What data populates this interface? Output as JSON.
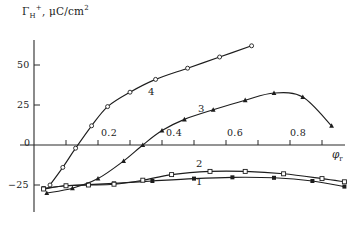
{
  "chart_data": {
    "type": "line",
    "title": "",
    "ylabel": "Γ H+, μC/cm2",
    "ylabel_main": "Γ",
    "ylabel_sub": "H",
    "ylabel_plus": "+",
    "ylabel_units": ", μC/cm",
    "ylabel_exp": "2",
    "xlabel": "φ",
    "xlabel_sub": "r",
    "xlim": [
      0.0,
      1.0
    ],
    "ylim": [
      -40,
      65
    ],
    "grid": false,
    "legend_position": "inline-curve-labels",
    "xticks": [
      0.2,
      0.4,
      0.6,
      0.8
    ],
    "xtick_labels": [
      "0.2",
      "0.4",
      "0.6",
      "0.8"
    ],
    "yticks": [
      50,
      25,
      0,
      -25
    ],
    "ytick_labels": [
      "50",
      "25",
      "0",
      "−25"
    ],
    "series": [
      {
        "name": "1",
        "label": "1",
        "marker": "filled-square",
        "x": [
          0.03,
          0.1,
          0.17,
          0.25,
          0.37,
          0.5,
          0.62,
          0.75,
          0.87,
          0.97
        ],
        "y": [
          -27.0,
          -25.5,
          -24.8,
          -24.0,
          -22.5,
          -21.0,
          -20.2,
          -20.5,
          -22.5,
          -26.0
        ]
      },
      {
        "name": "2",
        "label": "2",
        "marker": "open-square",
        "x": [
          0.03,
          0.1,
          0.17,
          0.25,
          0.34,
          0.43,
          0.55,
          0.66,
          0.78,
          0.9,
          0.97
        ],
        "y": [
          -27.5,
          -25.5,
          -25.0,
          -24.5,
          -22.0,
          -18.5,
          -16.5,
          -16.5,
          -18.0,
          -21.0,
          -23.0
        ]
      },
      {
        "name": "3",
        "label": "3",
        "marker": "filled-triangle",
        "x": [
          0.04,
          0.12,
          0.2,
          0.28,
          0.34,
          0.4,
          0.47,
          0.56,
          0.66,
          0.75,
          0.84,
          0.93
        ],
        "y": [
          -30.0,
          -27.0,
          -21.0,
          -10.0,
          0.0,
          9.0,
          16.0,
          22.0,
          28.0,
          32.5,
          30.0,
          12.0
        ]
      },
      {
        "name": "4",
        "label": "4",
        "marker": "open-circle",
        "x": [
          0.05,
          0.09,
          0.13,
          0.18,
          0.23,
          0.3,
          0.38,
          0.48,
          0.58,
          0.68
        ],
        "y": [
          -25.0,
          -14.0,
          -2.0,
          12.0,
          24.0,
          33.0,
          41.0,
          48.0,
          55.0,
          62.0
        ]
      }
    ]
  },
  "axes": {
    "y_axis_name": "y-axis",
    "x_axis_name": "x-axis"
  }
}
